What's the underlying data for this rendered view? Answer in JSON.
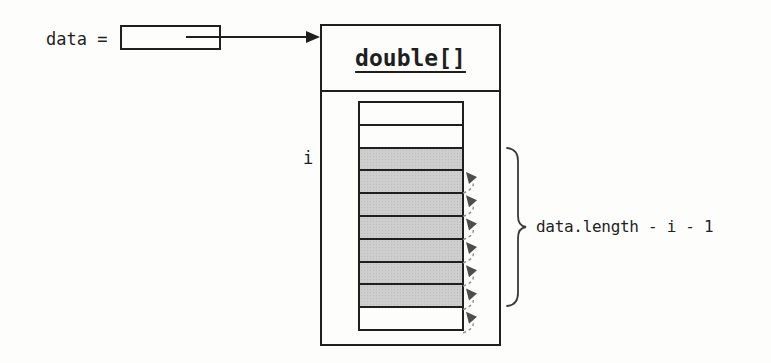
{
  "reference": {
    "label": "data ="
  },
  "object_box": {
    "type_label": "double[]"
  },
  "array": {
    "index_label": "i",
    "cells": [
      {
        "shaded": false
      },
      {
        "shaded": false
      },
      {
        "shaded": true
      },
      {
        "shaded": true
      },
      {
        "shaded": true
      },
      {
        "shaded": true
      },
      {
        "shaded": true
      },
      {
        "shaded": true
      },
      {
        "shaded": true
      },
      {
        "shaded": false
      }
    ],
    "shaded_count": 7,
    "move_arrow_count": 7,
    "move_direction": "up"
  },
  "annotation": {
    "brace_label": "data.length - i - 1"
  },
  "colors": {
    "line": "#1f1f1f",
    "cell_shade": "#cecece",
    "arc": "#8f8f8f",
    "arrowhead": "#4d4d4d",
    "background": "#fdfdfc"
  }
}
